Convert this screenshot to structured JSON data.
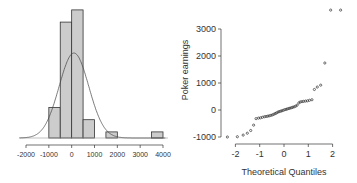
{
  "chart_data": [
    {
      "type": "bar",
      "subtype": "histogram",
      "title": "",
      "xlabel": "",
      "ylabel": "",
      "bin_edges": [
        -1000,
        -500,
        0,
        500,
        1000,
        1500,
        2000,
        2500,
        3000,
        3500,
        4000
      ],
      "counts": [
        5,
        19,
        21,
        3,
        0,
        1,
        0,
        0,
        0,
        1
      ],
      "x_ticks": [
        -2000,
        -1000,
        0,
        1000,
        2000,
        3000,
        4000
      ],
      "x_tick_labels": [
        "-2000",
        "-1000",
        "0",
        "1000",
        "2000",
        "3000",
        "4000"
      ],
      "xlim": [
        -2000,
        4000
      ],
      "overlay": {
        "type": "normal_density_curve",
        "mean": 100,
        "sd": 650
      },
      "grid": false,
      "y_axis_shown": false,
      "bar_fill": "#cccccc",
      "bar_stroke": "#333333"
    },
    {
      "type": "scatter",
      "subtype": "normal_qq_plot",
      "title": "",
      "xlabel": "Theoretical Quantiles",
      "ylabel": "Poker earnings",
      "x_ticks": [
        -2,
        -1,
        0,
        1,
        2
      ],
      "x_tick_labels": [
        "-2",
        "-1",
        "0",
        "1",
        "2"
      ],
      "y_ticks": [
        -1000,
        0,
        1000,
        2000,
        3000
      ],
      "y_tick_labels": [
        "-1000",
        "0",
        "1000",
        "2000",
        "3000"
      ],
      "xlim": [
        -2.4,
        2.4
      ],
      "ylim": [
        -1000,
        3700
      ],
      "grid": false,
      "points": {
        "x": [
          -2.33,
          -1.92,
          -1.68,
          -1.51,
          -1.37,
          -1.25,
          -1.15,
          -1.05,
          -0.97,
          -0.89,
          -0.81,
          -0.74,
          -0.67,
          -0.61,
          -0.54,
          -0.48,
          -0.42,
          -0.36,
          -0.31,
          -0.25,
          -0.2,
          -0.14,
          -0.09,
          -0.03,
          0.03,
          0.09,
          0.14,
          0.2,
          0.25,
          0.31,
          0.36,
          0.42,
          0.48,
          0.54,
          0.61,
          0.67,
          0.74,
          0.81,
          0.89,
          0.97,
          1.05,
          1.15,
          1.25,
          1.37,
          1.51,
          1.68,
          1.92,
          2.33
        ],
        "y": [
          -1000,
          -990,
          -930,
          -860,
          -760,
          -560,
          -320,
          -300,
          -290,
          -270,
          -250,
          -240,
          -230,
          -215,
          -200,
          -180,
          -160,
          -130,
          -110,
          -80,
          -60,
          -45,
          -30,
          -10,
          10,
          25,
          40,
          55,
          70,
          85,
          100,
          120,
          140,
          180,
          260,
          300,
          310,
          320,
          330,
          340,
          360,
          380,
          760,
          850,
          920,
          1740,
          3700,
          3700
        ]
      },
      "point_color": "#333333"
    }
  ]
}
